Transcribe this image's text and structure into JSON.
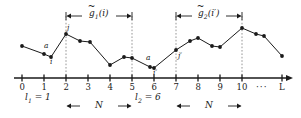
{
  "figure": {
    "type": "diagram",
    "axis": {
      "y_px": 78,
      "x_start_px": 14,
      "x_end_px": 292,
      "unit_px": 22.0,
      "origin_px": 22,
      "ticks": [
        {
          "label": "0",
          "value": 0,
          "x_px": 22
        },
        {
          "label": "1",
          "value": 1,
          "x_px": 44
        },
        {
          "label": "2",
          "value": 2,
          "x_px": 66
        },
        {
          "label": "3",
          "value": 3,
          "x_px": 88
        },
        {
          "label": "4",
          "value": 4,
          "x_px": 110
        },
        {
          "label": "5",
          "value": 5,
          "x_px": 132
        },
        {
          "label": "6",
          "value": 6,
          "x_px": 154
        },
        {
          "label": "7",
          "value": 7,
          "x_px": 176
        },
        {
          "label": "8",
          "value": 8,
          "x_px": 198
        },
        {
          "label": "9",
          "value": 9,
          "x_px": 220
        },
        {
          "label": "10",
          "value": 10,
          "x_px": 242
        },
        {
          "label": "···",
          "value": null,
          "x_px": 262
        },
        {
          "label": "L",
          "value": null,
          "x_px": 282
        }
      ]
    },
    "series": {
      "name": "data-polyline",
      "points": [
        {
          "x_px": 22,
          "y_px": 46
        },
        {
          "x_px": 44,
          "y_px": 54
        },
        {
          "x_px": 51,
          "y_px": 57
        },
        {
          "x_px": 66,
          "y_px": 34
        },
        {
          "x_px": 80,
          "y_px": 41
        },
        {
          "x_px": 90,
          "y_px": 42
        },
        {
          "x_px": 110,
          "y_px": 65
        },
        {
          "x_px": 124,
          "y_px": 57
        },
        {
          "x_px": 132,
          "y_px": 58
        },
        {
          "x_px": 150,
          "y_px": 67
        },
        {
          "x_px": 154,
          "y_px": 68
        },
        {
          "x_px": 176,
          "y_px": 50
        },
        {
          "x_px": 190,
          "y_px": 41
        },
        {
          "x_px": 198,
          "y_px": 38
        },
        {
          "x_px": 212,
          "y_px": 46
        },
        {
          "x_px": 220,
          "y_px": 47
        },
        {
          "x_px": 242,
          "y_px": 28
        },
        {
          "x_px": 256,
          "y_px": 34
        },
        {
          "x_px": 264,
          "y_px": 36
        },
        {
          "x_px": 282,
          "y_px": 56
        }
      ]
    },
    "guide_lines": [
      {
        "x_px": 66,
        "top_px": 16,
        "bottom_px": 78
      },
      {
        "x_px": 132,
        "top_px": 16,
        "bottom_px": 78
      },
      {
        "x_px": 176,
        "top_px": 16,
        "bottom_px": 78
      },
      {
        "x_px": 242,
        "top_px": 16,
        "bottom_px": 78
      }
    ],
    "point_labels": [
      {
        "name": "label-a-left",
        "text": "a",
        "x_px": 46,
        "y_px": 42
      },
      {
        "name": "label-i-left",
        "text": "i",
        "x_px": 51,
        "y_px": 58
      },
      {
        "name": "label-j-left",
        "text": "j",
        "x_px": 68,
        "y_px": 24
      },
      {
        "name": "label-a-right",
        "text": "a",
        "x_px": 148,
        "y_px": 54
      },
      {
        "name": "label-i-right",
        "text": "i′",
        "x_px": 155,
        "y_px": 69
      },
      {
        "name": "label-j-right",
        "text": "j′",
        "x_px": 180,
        "y_px": 52
      }
    ],
    "top_brackets": [
      {
        "name": "bracket-g1",
        "label_base": "g",
        "label_sub": "1",
        "label_arg": "(i)",
        "from_x_px": 66,
        "to_x_px": 132,
        "y_px": 16
      },
      {
        "name": "bracket-g2",
        "label_base": "g",
        "label_sub": "2",
        "label_arg": "(i′)",
        "from_x_px": 176,
        "to_x_px": 242,
        "y_px": 16
      }
    ],
    "bottom_brackets": [
      {
        "name": "bracket-n-left",
        "label": "N",
        "from_x_px": 66,
        "to_x_px": 132,
        "y_px": 106
      },
      {
        "name": "bracket-n-right",
        "label": "N",
        "from_x_px": 176,
        "to_x_px": 242,
        "y_px": 106
      }
    ],
    "start_markers": [
      {
        "name": "marker-l1",
        "base": "l",
        "sub": "1",
        "eq": " = 1",
        "x_px": 25,
        "y_px": 93
      },
      {
        "name": "marker-l2",
        "base": "l",
        "sub": "2",
        "eq": " = 6",
        "x_px": 135,
        "y_px": 93
      }
    ],
    "colors": {
      "ink": "#1a1a1a",
      "guide": "#8a8a8a",
      "background": "#ffffff"
    }
  }
}
